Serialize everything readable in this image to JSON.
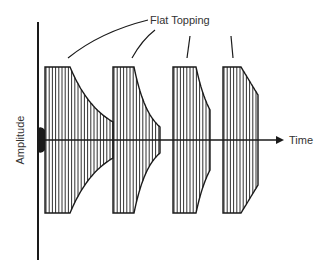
{
  "diagram": {
    "annotation": "Flat Topping",
    "x_axis_label": "Time",
    "y_axis_label": "Amplitude",
    "colors": {
      "ink": "#1a1a1a",
      "background": "#ffffff"
    },
    "bursts": [
      {
        "index": 1,
        "x_start": 45,
        "flat_end": 70,
        "x_end": 113,
        "top": 67,
        "end_top": 122,
        "shape": "exponential"
      },
      {
        "index": 2,
        "x_start": 113,
        "flat_end": 134,
        "x_end": 160,
        "top": 67,
        "end_top": 127,
        "shape": "exponential"
      },
      {
        "index": 3,
        "x_start": 173,
        "flat_end": 196,
        "x_end": 210,
        "top": 67,
        "end_top": 110,
        "shape": "exponential"
      },
      {
        "index": 4,
        "x_start": 223,
        "flat_end": 241,
        "x_end": 258,
        "top": 67,
        "end_top": 95,
        "shape": "linear"
      }
    ]
  }
}
